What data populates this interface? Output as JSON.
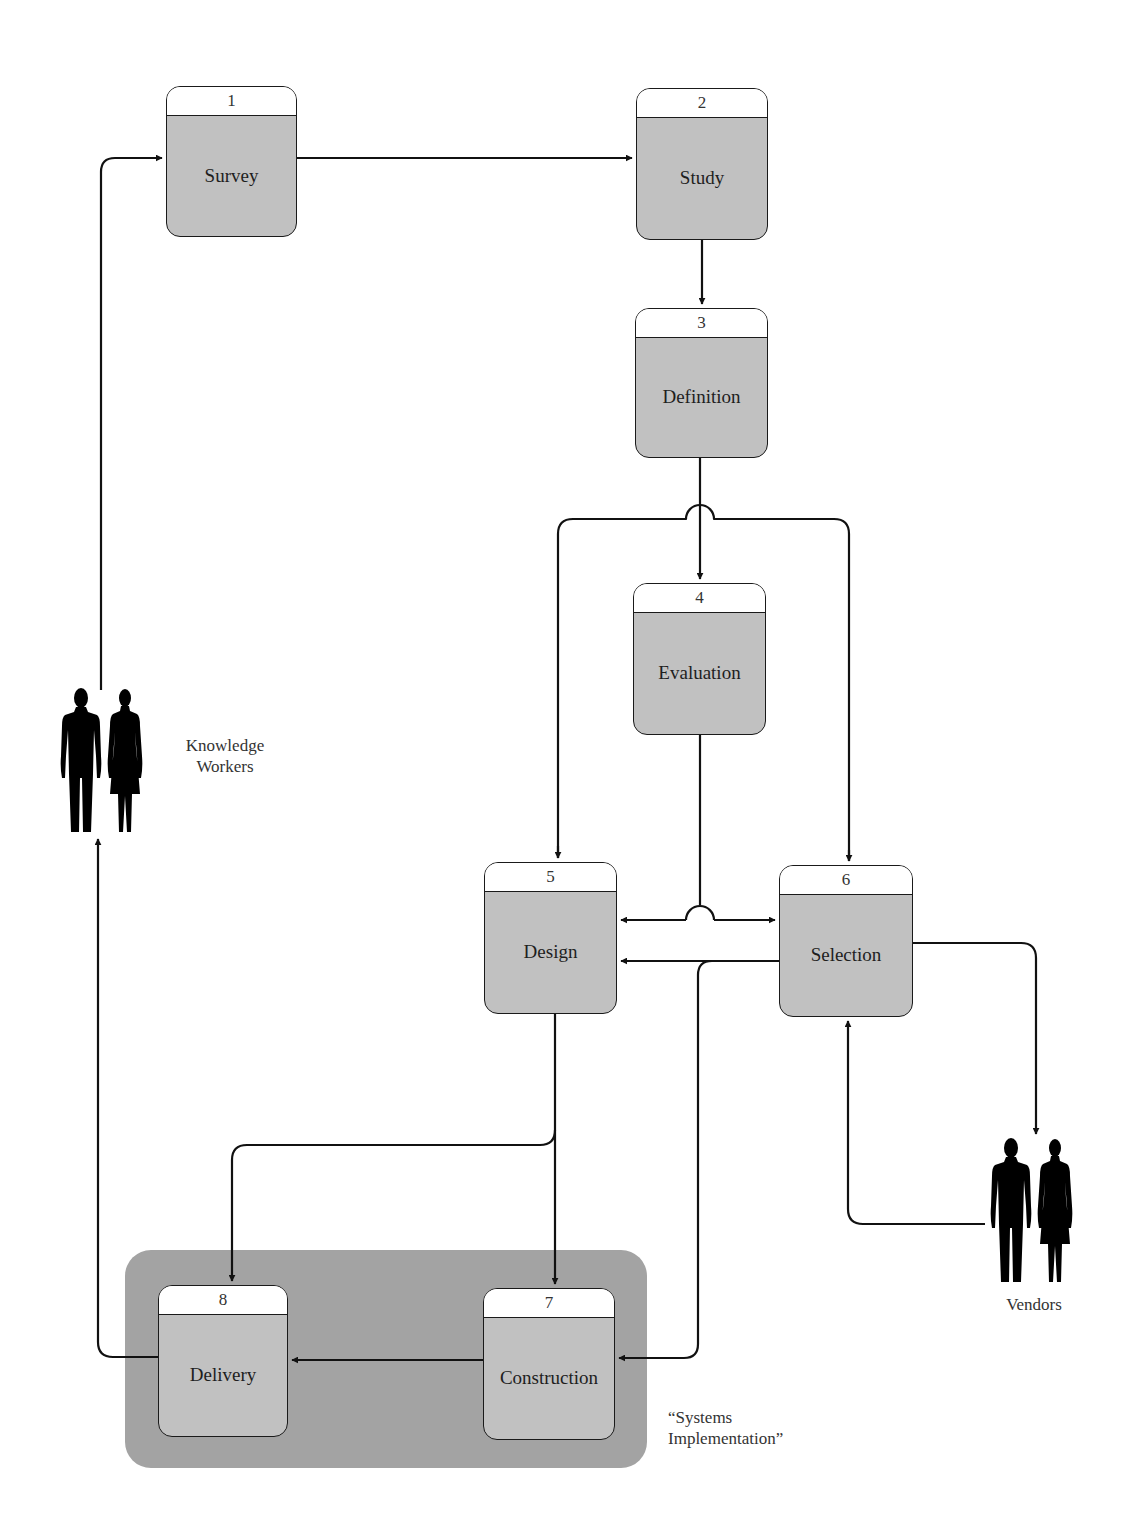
{
  "diagram": {
    "type": "process-flow",
    "colors": {
      "process_fill": "#c1c1c1",
      "header_fill": "#ffffff",
      "group_fill": "#a3a3a3",
      "stroke": "#1a1a1a"
    },
    "nodes": [
      {
        "id": "1",
        "number": "1",
        "label": "Survey"
      },
      {
        "id": "2",
        "number": "2",
        "label": "Study"
      },
      {
        "id": "3",
        "number": "3",
        "label": "Definition"
      },
      {
        "id": "4",
        "number": "4",
        "label": "Evaluation"
      },
      {
        "id": "5",
        "number": "5",
        "label": "Design"
      },
      {
        "id": "6",
        "number": "6",
        "label": "Selection"
      },
      {
        "id": "7",
        "number": "7",
        "label": "Construction"
      },
      {
        "id": "8",
        "number": "8",
        "label": "Delivery"
      }
    ],
    "actors": {
      "knowledge_workers": {
        "line1": "Knowledge",
        "line2": "Workers",
        "icon": "people-icon"
      },
      "vendors": {
        "label": "Vendors",
        "icon": "people-icon"
      }
    },
    "group": {
      "line1": "“Systems",
      "line2": "Implementation”"
    },
    "edges": [
      {
        "from": "Knowledge Workers",
        "to": "1"
      },
      {
        "from": "1",
        "to": "2"
      },
      {
        "from": "2",
        "to": "3"
      },
      {
        "from": "3",
        "to": "4"
      },
      {
        "from": "3",
        "to": "5"
      },
      {
        "from": "3",
        "to": "6"
      },
      {
        "from": "4",
        "to": "5"
      },
      {
        "from": "4",
        "to": "6"
      },
      {
        "from": "6",
        "to": "5"
      },
      {
        "from": "6",
        "to": "7"
      },
      {
        "from": "6",
        "to": "Vendors"
      },
      {
        "from": "Vendors",
        "to": "6"
      },
      {
        "from": "5",
        "to": "8"
      },
      {
        "from": "5",
        "to": "7"
      },
      {
        "from": "7",
        "to": "8"
      },
      {
        "from": "8",
        "to": "Knowledge Workers"
      }
    ]
  }
}
